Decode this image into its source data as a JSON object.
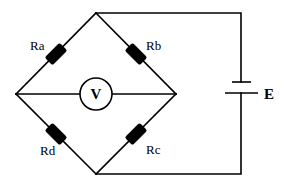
{
  "diagram": {
    "colors": {
      "line": "#000000",
      "background": "#ffffff"
    },
    "nodes": {
      "top": [
        96,
        13
      ],
      "left": [
        16,
        94
      ],
      "right": [
        176,
        94
      ],
      "bottom": [
        96,
        174
      ]
    },
    "resistors": [
      {
        "id": "Ra",
        "label": "Ra",
        "branch": "left-top",
        "center": [
          56,
          54
        ]
      },
      {
        "id": "Rb",
        "label": "Rb",
        "branch": "top-right",
        "center": [
          136,
          54
        ]
      },
      {
        "id": "Rc",
        "label": "Rc",
        "branch": "right-bottom",
        "center": [
          136,
          134
        ]
      },
      {
        "id": "Rd",
        "label": "Rd",
        "branch": "bottom-left",
        "center": [
          56,
          134
        ]
      }
    ],
    "meter": {
      "label": "V",
      "type": "voltmeter",
      "center": [
        96,
        94
      ],
      "radius": 16
    },
    "source": {
      "label": "E",
      "type": "battery",
      "x": 241
    }
  }
}
